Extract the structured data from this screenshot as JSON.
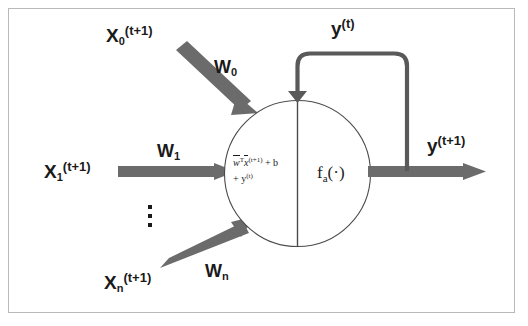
{
  "diagram": {
    "colors": {
      "frame_border": "#b9b9b9",
      "arrow_gray": "#6b6b6b",
      "loop_gray": "#595959",
      "circle_stroke": "#4a4a4a",
      "text": "#1a1a1a",
      "background": "#ffffff"
    },
    "inputs": [
      {
        "id": "x0",
        "label_base": "X",
        "label_sub": "0",
        "label_sup": "(t+1)",
        "weight_base": "W",
        "weight_sub": "0",
        "arrow": "diagonal-down-right"
      },
      {
        "id": "x1",
        "label_base": "X",
        "label_sub": "1",
        "label_sup": "(t+1)",
        "weight_base": "W",
        "weight_sub": "1",
        "arrow": "horizontal-right"
      },
      {
        "id": "xn",
        "label_base": "X",
        "label_sub": "n",
        "label_sup": "(t+1)",
        "weight_base": "W",
        "weight_sub": "n",
        "arrow": "diagonal-up-right"
      }
    ],
    "ellipsis": "⋮",
    "neuron": {
      "summation": {
        "line1_prefix": "w",
        "line1_transpose": "T",
        "line1_var": "x",
        "line1_sup": "(t+1)",
        "line1_plus_b": "+ b",
        "line2": "+ y",
        "line2_sup": "(t)"
      },
      "activation_base": "f",
      "activation_sub": "a",
      "activation_arg": "(·)"
    },
    "feedback": {
      "label_base": "y",
      "label_sup": "(t)",
      "path": "output-to-neuron-top"
    },
    "output": {
      "label_base": "y",
      "label_sup": "(t+1)",
      "arrow": "horizontal-right"
    }
  }
}
